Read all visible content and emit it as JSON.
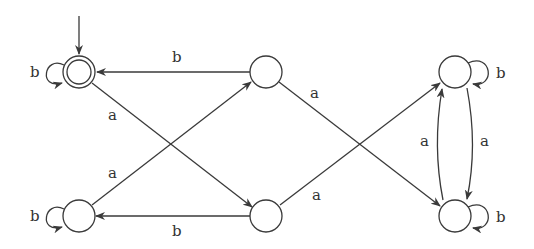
{
  "diagram": {
    "type": "finite-automaton",
    "alphabet": [
      "a",
      "b"
    ],
    "colors": {
      "stroke": "#3a3a3a",
      "background": "#ffffff",
      "text": "#333333"
    },
    "states": [
      {
        "id": "q0",
        "x": 79,
        "y": 72,
        "accepting": true,
        "initial": true
      },
      {
        "id": "q1",
        "x": 266,
        "y": 72,
        "accepting": false,
        "initial": false
      },
      {
        "id": "q2",
        "x": 455,
        "y": 72,
        "accepting": false,
        "initial": false
      },
      {
        "id": "q3",
        "x": 79,
        "y": 216,
        "accepting": false,
        "initial": false
      },
      {
        "id": "q4",
        "x": 266,
        "y": 216,
        "accepting": false,
        "initial": false
      },
      {
        "id": "q5",
        "x": 455,
        "y": 216,
        "accepting": false,
        "initial": false
      }
    ],
    "transitions": [
      {
        "from": "q0",
        "to": "q0",
        "label": "b"
      },
      {
        "from": "q1",
        "to": "q0",
        "label": "b"
      },
      {
        "from": "q0",
        "to": "q4",
        "label": "a"
      },
      {
        "from": "q3",
        "to": "q1",
        "label": "a"
      },
      {
        "from": "q3",
        "to": "q3",
        "label": "b"
      },
      {
        "from": "q4",
        "to": "q3",
        "label": "b"
      },
      {
        "from": "q1",
        "to": "q5",
        "label": "a"
      },
      {
        "from": "q4",
        "to": "q2",
        "label": "a"
      },
      {
        "from": "q2",
        "to": "q2",
        "label": "b"
      },
      {
        "from": "q5",
        "to": "q5",
        "label": "b"
      },
      {
        "from": "q5",
        "to": "q2",
        "label": "a"
      },
      {
        "from": "q2",
        "to": "q5",
        "label": "a"
      }
    ],
    "labels": {
      "q0_loop": "b",
      "q1_q0": "b",
      "q0_q4": "a",
      "q3_q1": "a",
      "q3_loop": "b",
      "q4_q3": "b",
      "q1_q5": "a",
      "q4_q2": "a",
      "q2_loop": "b",
      "q5_loop": "b",
      "q5_q2": "a",
      "q2_q5": "a"
    }
  }
}
